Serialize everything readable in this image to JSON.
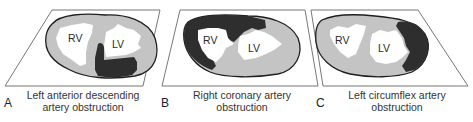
{
  "figure": {
    "colors": {
      "myocardium": "#c4c4c4",
      "infarct": "#2e2e2e",
      "cavity": "#ffffff",
      "outline": "#1e1e1e",
      "plane": "#777777"
    },
    "panels": [
      {
        "letter": "A",
        "caption_line1": "Left anterior descending",
        "caption_line2": "artery obstruction",
        "chamber_labels": [
          "RV",
          "LV"
        ],
        "infarct_region": "anterior septum and anterior left ventricular wall (apical)"
      },
      {
        "letter": "B",
        "caption_line1": "Right coronary artery",
        "caption_line2": "obstruction",
        "chamber_labels": [
          "RV",
          "LV"
        ],
        "infarct_region": "right ventricular free wall and posterior septum"
      },
      {
        "letter": "C",
        "caption_line1": "Left circumflex artery",
        "caption_line2": "obstruction",
        "chamber_labels": [
          "RV",
          "LV"
        ],
        "infarct_region": "lateral left ventricular wall"
      }
    ]
  }
}
